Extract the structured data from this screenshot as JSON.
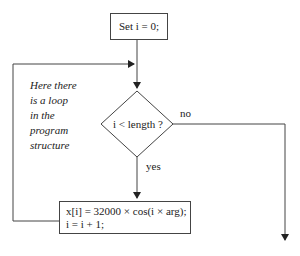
{
  "diagram": {
    "type": "flowchart",
    "start_box": {
      "label": "Set i = 0;"
    },
    "decision": {
      "label": "i < length ?",
      "yes_label": "yes",
      "no_label": "no"
    },
    "process_box": {
      "line1": "x[i] = 32000 × cos(i × arg);",
      "line2": "i = i + 1;"
    },
    "annotation": {
      "lines": [
        "Here there",
        "is a loop",
        "in the",
        "program",
        "structure"
      ]
    },
    "colors": {
      "line": "#444444",
      "background": "#ffffff"
    }
  }
}
